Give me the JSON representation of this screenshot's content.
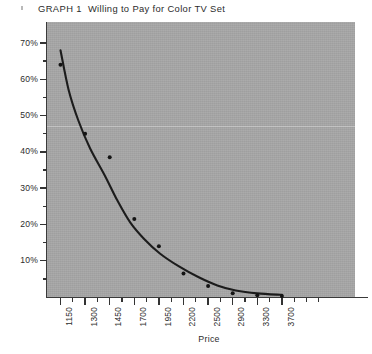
{
  "figure": {
    "title_label": "GRAPH 1",
    "title_text": "Willing to Pay for Color TV Set",
    "background_color": "#ffffff",
    "plot_background_color": "#a6a6a6",
    "ink_color": "#1c1c1c"
  },
  "chart_data": {
    "type": "scatter",
    "xlabel": "Price",
    "ylabel": "",
    "grid": false,
    "legend": "none",
    "xlim": [
      1075,
      3925
    ],
    "ylim": [
      0,
      75
    ],
    "x_tick_labels": [
      "1150",
      "1300",
      "1450",
      "1700",
      "1950",
      "2200",
      "2500",
      "2900",
      "3300",
      "3700"
    ],
    "x_tick_values": [
      1150,
      1300,
      1450,
      1700,
      1950,
      2200,
      2500,
      2900,
      3300,
      3700
    ],
    "y_tick_labels": [
      "10%",
      "20%",
      "30%",
      "40%",
      "50%",
      "60%",
      "70%"
    ],
    "y_tick_values": [
      10,
      20,
      30,
      40,
      50,
      60,
      70
    ],
    "y_minor_tick_values": [
      5,
      15,
      25,
      35,
      45,
      55,
      65
    ],
    "series": [
      {
        "name": "Percent willing to pay",
        "points": [
          {
            "x": 1150,
            "y": 64.0
          },
          {
            "x": 1300,
            "y": 45.0
          },
          {
            "x": 1450,
            "y": 38.5
          },
          {
            "x": 1700,
            "y": 21.5
          },
          {
            "x": 1950,
            "y": 14.0
          },
          {
            "x": 2200,
            "y": 6.5
          },
          {
            "x": 2500,
            "y": 3.0
          },
          {
            "x": 2900,
            "y": 1.0
          },
          {
            "x": 3300,
            "y": 0.5
          },
          {
            "x": 3700,
            "y": 0.3
          }
        ]
      }
    ],
    "fit_curve": {
      "name": "fitted demand curve",
      "description": "exponential decay fit from 68% at low price to near 0% at high price",
      "points": [
        {
          "x": 1150,
          "y": 68.0
        },
        {
          "x": 1200,
          "y": 57.0
        },
        {
          "x": 1260,
          "y": 48.5
        },
        {
          "x": 1330,
          "y": 41.0
        },
        {
          "x": 1420,
          "y": 33.5
        },
        {
          "x": 1530,
          "y": 26.5
        },
        {
          "x": 1660,
          "y": 20.5
        },
        {
          "x": 1800,
          "y": 16.0
        },
        {
          "x": 1960,
          "y": 12.0
        },
        {
          "x": 2150,
          "y": 8.5
        },
        {
          "x": 2380,
          "y": 5.5
        },
        {
          "x": 2650,
          "y": 3.2
        },
        {
          "x": 2950,
          "y": 1.8
        },
        {
          "x": 3300,
          "y": 1.0
        },
        {
          "x": 3700,
          "y": 0.6
        }
      ]
    }
  }
}
